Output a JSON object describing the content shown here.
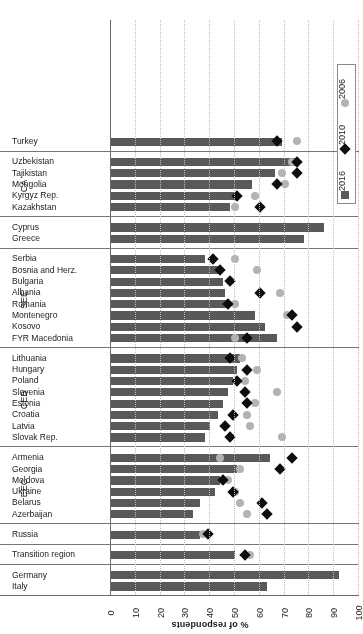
{
  "chart_data": {
    "type": "bar",
    "title": "",
    "xlabel": "% of respondents",
    "ylabel": "",
    "xlim": [
      0,
      100
    ],
    "x_ticks": [
      100,
      90,
      80,
      70,
      60,
      50,
      40,
      30,
      20,
      10,
      0
    ],
    "x_axis_direction": "reversed-left-to-right",
    "grid": "dotted vertical gridlines at every 10",
    "orientation": "horizontal-bars-rotated-180",
    "legend": {
      "position": "bottom-left-vertical",
      "entries": [
        {
          "label": "2016",
          "marker": "square",
          "color": "#595959"
        },
        {
          "label": "2010",
          "marker": "diamond",
          "color": "#0d0d0d"
        },
        {
          "label": "2006",
          "marker": "circle",
          "color": "#b3b3b3"
        }
      ]
    },
    "series": [
      {
        "name": "2016",
        "marker": "bar"
      },
      {
        "name": "2010",
        "marker": "diamond"
      },
      {
        "name": "2006",
        "marker": "circle"
      }
    ],
    "groups": [
      {
        "name": "",
        "categories": [
          {
            "label": "Italy",
            "v2016": 63,
            "v2010": null,
            "v2006": null
          },
          {
            "label": "Germany",
            "v2016": 92,
            "v2010": null,
            "v2006": null
          }
        ]
      },
      {
        "name": "",
        "categories": [
          {
            "label": "Transition region",
            "v2016": 50,
            "v2010": 54,
            "v2006": 56
          }
        ]
      },
      {
        "name": "",
        "categories": [
          {
            "label": "Russia",
            "v2016": 36,
            "v2010": 39,
            "v2006": 37
          }
        ]
      },
      {
        "name": "EEC",
        "categories": [
          {
            "label": "Azerbaijan",
            "v2016": 33,
            "v2010": 63,
            "v2006": 55
          },
          {
            "label": "Belarus",
            "v2016": 36,
            "v2010": 61,
            "v2006": 52
          },
          {
            "label": "Ukraine",
            "v2016": 42,
            "v2010": 49,
            "v2006": 50
          },
          {
            "label": "Moldova",
            "v2016": 44,
            "v2010": 45,
            "v2006": 47
          },
          {
            "label": "Georgia",
            "v2016": 51,
            "v2010": 68,
            "v2006": 52
          },
          {
            "label": "Armenia",
            "v2016": 64,
            "v2010": 73,
            "v2006": 44
          }
        ]
      },
      {
        "name": "CEB",
        "categories": [
          {
            "label": "Slovak Rep.",
            "v2016": 38,
            "v2010": 48,
            "v2006": 69
          },
          {
            "label": "Latvia",
            "v2016": 40,
            "v2010": 46,
            "v2006": 56
          },
          {
            "label": "Croatia",
            "v2016": 43,
            "v2010": 49,
            "v2006": 55
          },
          {
            "label": "Estonia",
            "v2016": 45,
            "v2010": 55,
            "v2006": 58
          },
          {
            "label": "Slovenia",
            "v2016": 47,
            "v2010": 54,
            "v2006": 67
          },
          {
            "label": "Poland",
            "v2016": 49,
            "v2010": 51,
            "v2006": 54
          },
          {
            "label": "Hungary",
            "v2016": 51,
            "v2010": 55,
            "v2006": 59
          },
          {
            "label": "Lithuania",
            "v2016": 52,
            "v2010": 48,
            "v2006": 53
          }
        ]
      },
      {
        "name": "SEE",
        "categories": [
          {
            "label": "FYR Macedonia",
            "v2016": 67,
            "v2010": 55,
            "v2006": 50
          },
          {
            "label": "Kosovo",
            "v2016": 62,
            "v2010": 75,
            "v2006": null
          },
          {
            "label": "Montenegro",
            "v2016": 58,
            "v2010": 73,
            "v2006": 71
          },
          {
            "label": "Romania",
            "v2016": 47,
            "v2010": 47,
            "v2006": 50
          },
          {
            "label": "Albania",
            "v2016": 46,
            "v2010": 60,
            "v2006": 68
          },
          {
            "label": "Bulgaria",
            "v2016": 45,
            "v2010": 48,
            "v2006": 48
          },
          {
            "label": "Bosnia and Herz.",
            "v2016": 43,
            "v2010": 44,
            "v2006": 59
          },
          {
            "label": "Serbia",
            "v2016": 38,
            "v2010": 41,
            "v2006": 50
          }
        ]
      },
      {
        "name": "",
        "categories": [
          {
            "label": "Greece",
            "v2016": 78,
            "v2010": null,
            "v2006": null
          },
          {
            "label": "Cyprus",
            "v2016": 86,
            "v2010": null,
            "v2006": null
          }
        ]
      },
      {
        "name": "CA",
        "categories": [
          {
            "label": "Kazakhstan",
            "v2016": 48,
            "v2010": 60,
            "v2006": 50
          },
          {
            "label": "Kyrgyz Rep.",
            "v2016": 51,
            "v2010": 51,
            "v2006": 58
          },
          {
            "label": "Mongolia",
            "v2016": 57,
            "v2010": 67,
            "v2006": 70
          },
          {
            "label": "Tajikistan",
            "v2016": 66,
            "v2010": 75,
            "v2006": 69
          },
          {
            "label": "Uzbekistan",
            "v2016": 76,
            "v2010": 75,
            "v2006": 73
          }
        ]
      },
      {
        "name": "",
        "categories": [
          {
            "label": "Turkey",
            "v2016": 69,
            "v2010": 67,
            "v2006": 75
          }
        ]
      }
    ]
  }
}
